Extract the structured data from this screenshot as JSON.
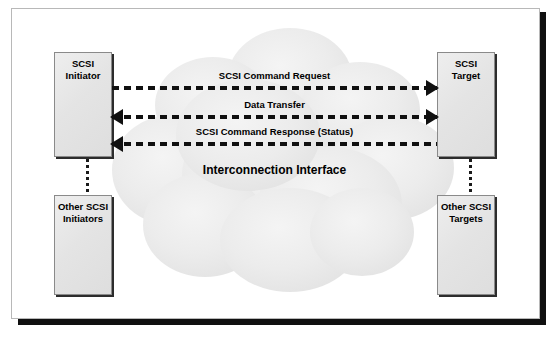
{
  "diagram": {
    "cloud": {
      "label": "Interconnection Interface",
      "fill_color": "#eaeaea"
    },
    "nodes": {
      "scsi_initiator": {
        "line1": "SCSI",
        "line2": "Initiator"
      },
      "scsi_target": {
        "line1": "SCSI",
        "line2": "Target"
      },
      "other_initiators": {
        "line1": "Other SCSI",
        "line2": "Initiators"
      },
      "other_targets": {
        "line1": "Other SCSI",
        "line2": "Targets"
      }
    },
    "flows": [
      {
        "label": "SCSI Command Request",
        "direction": "right",
        "arrow_left": false,
        "arrow_right": true
      },
      {
        "label": "Data Transfer",
        "direction": "both",
        "arrow_left": true,
        "arrow_right": true
      },
      {
        "label": "SCSI Command Response (Status)",
        "direction": "left",
        "arrow_left": true,
        "arrow_right": false
      }
    ],
    "colors": {
      "box_fill": "#e6e6e6",
      "box_border": "#8a8a8a",
      "box_shadow": "#2c2c2c",
      "line": "#101010",
      "frame_border": "#b8b8b8",
      "page_shadow": "#101010"
    }
  }
}
